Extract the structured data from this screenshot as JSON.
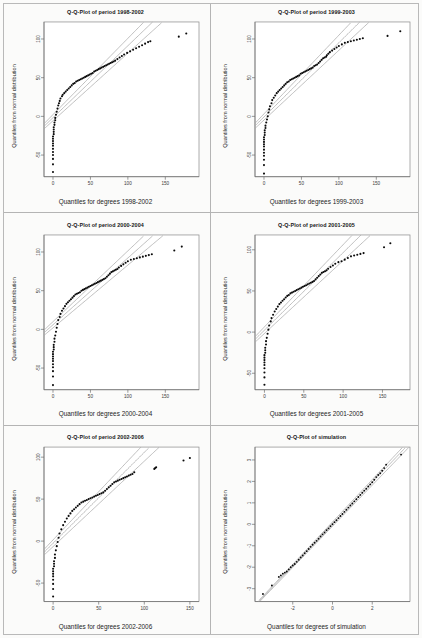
{
  "figure": {
    "kind": "qq-plot-grid",
    "rows": 3,
    "cols": 2,
    "background": "#fbfbfa",
    "divider_color": "#b4b4b4",
    "point_color": "#0a0a0a",
    "reference_line_color": "#a9a9a9"
  },
  "chart_data": [
    {
      "id": "panel-1",
      "type": "scatter",
      "title": "Q-Q-Plot of period 1998-2002",
      "xlabel": "Quantiles for degrees 1998-2002",
      "ylabel": "Quantiles from normal distribution",
      "xlim": [
        -12,
        195
      ],
      "ylim": [
        -78,
        122
      ],
      "xticks": [
        0,
        50,
        100,
        150
      ],
      "yticks": [
        100,
        50,
        0,
        -50
      ],
      "grid": false,
      "legend": "none",
      "reference_lines": 3,
      "annotation": "Heavy-tailed: steep lower tail, convex body, two far outliers near x=170-180",
      "x": [
        0,
        0,
        0,
        0,
        0,
        0,
        0,
        0,
        0,
        0,
        0,
        1,
        1,
        1,
        1,
        2,
        2,
        3,
        3,
        4,
        5,
        6,
        7,
        8,
        9,
        10,
        12,
        13,
        15,
        17,
        19,
        21,
        23,
        25,
        27,
        29,
        31,
        33,
        35,
        37,
        39,
        41,
        43,
        45,
        47,
        49,
        51,
        53,
        55,
        57,
        59,
        61,
        63,
        65,
        67,
        69,
        71,
        73,
        75,
        77,
        79,
        81,
        83,
        86,
        89,
        92,
        95,
        99,
        103,
        107,
        111,
        115,
        119,
        123,
        127,
        130,
        168,
        178
      ],
      "y": [
        -72,
        -62,
        -55,
        -50,
        -46,
        -42,
        -38,
        -35,
        -32,
        -29,
        -26,
        -23,
        -20,
        -17,
        -14,
        -11,
        -8,
        -5,
        -2,
        2,
        6,
        10,
        14,
        17,
        20,
        23,
        26,
        28,
        30,
        32,
        34,
        36,
        38,
        40,
        42,
        43,
        45,
        46,
        47,
        48,
        49,
        50,
        51,
        52,
        53,
        54,
        55,
        56,
        58,
        59,
        60,
        61,
        62,
        63,
        64,
        65,
        66,
        67,
        68,
        69,
        70,
        71,
        72,
        74,
        76,
        78,
        80,
        82,
        84,
        86,
        88,
        90,
        92,
        94,
        96,
        97,
        103,
        107
      ]
    },
    {
      "id": "panel-2",
      "type": "scatter",
      "title": "Q-Q-Plot of period 1999-2003",
      "xlabel": "Quantiles for degrees 1999-2003",
      "ylabel": "Quantiles from normal distribution",
      "xlim": [
        -12,
        195
      ],
      "ylim": [
        -78,
        122
      ],
      "xticks": [
        0,
        50,
        100,
        150
      ],
      "yticks": [
        100,
        50,
        0,
        -50
      ],
      "grid": false,
      "legend": "none",
      "reference_lines": 3,
      "annotation": "Similar heavy-tailed shape; outliers near x=165 and x=182",
      "x": [
        0,
        0,
        0,
        0,
        0,
        0,
        0,
        0,
        0,
        0,
        0,
        1,
        1,
        1,
        2,
        2,
        3,
        4,
        5,
        6,
        7,
        8,
        10,
        11,
        13,
        15,
        17,
        19,
        21,
        23,
        25,
        27,
        29,
        31,
        33,
        35,
        37,
        39,
        41,
        43,
        45,
        47,
        49,
        51,
        53,
        55,
        57,
        59,
        61,
        63,
        65,
        67,
        69,
        71,
        73,
        75,
        77,
        79,
        81,
        83,
        84,
        86,
        88,
        91,
        94,
        97,
        100,
        104,
        108,
        112,
        116,
        120,
        124,
        128,
        132,
        165,
        182
      ],
      "y": [
        -74,
        -63,
        -56,
        -51,
        -47,
        -43,
        -39,
        -36,
        -33,
        -30,
        -27,
        -24,
        -21,
        -18,
        -15,
        -12,
        -8,
        -4,
        0,
        5,
        9,
        13,
        17,
        21,
        24,
        27,
        30,
        32,
        34,
        36,
        38,
        40,
        42,
        44,
        45,
        47,
        48,
        49,
        50,
        51,
        52,
        53,
        55,
        56,
        57,
        58,
        59,
        60,
        61,
        62,
        63,
        65,
        66,
        67,
        69,
        71,
        73,
        75,
        76,
        77,
        79,
        81,
        83,
        85,
        87,
        89,
        91,
        93,
        95,
        96,
        97,
        98,
        99,
        100,
        101,
        104,
        110
      ]
    },
    {
      "id": "panel-3",
      "type": "scatter",
      "title": "Q-Q-Plot of period 2000-2004",
      "xlabel": "Quantiles for degrees 2000-2004",
      "ylabel": "Quantiles from normal distribution",
      "xlim": [
        -12,
        195
      ],
      "ylim": [
        -78,
        122
      ],
      "xticks": [
        0,
        50,
        100,
        150
      ],
      "yticks": [
        100,
        50,
        0,
        -50
      ],
      "grid": false,
      "legend": "none",
      "reference_lines": 3,
      "annotation": "Heavy-tailed; outliers near x=162 and x=172",
      "x": [
        0,
        0,
        0,
        0,
        0,
        0,
        0,
        0,
        0,
        0,
        1,
        1,
        1,
        2,
        2,
        3,
        4,
        5,
        6,
        7,
        9,
        10,
        12,
        14,
        16,
        18,
        20,
        22,
        24,
        26,
        28,
        30,
        32,
        34,
        36,
        38,
        40,
        42,
        44,
        46,
        48,
        50,
        52,
        54,
        56,
        58,
        60,
        62,
        64,
        66,
        68,
        70,
        72,
        74,
        76,
        78,
        80,
        82,
        84,
        86,
        88,
        91,
        94,
        97,
        100,
        104,
        108,
        112,
        116,
        120,
        124,
        128,
        132,
        162,
        172
      ],
      "y": [
        -72,
        -61,
        -54,
        -49,
        -45,
        -41,
        -38,
        -35,
        -32,
        -29,
        -26,
        -23,
        -20,
        -16,
        -12,
        -8,
        -3,
        2,
        7,
        12,
        16,
        20,
        24,
        27,
        30,
        33,
        35,
        37,
        39,
        41,
        43,
        45,
        46,
        47,
        48,
        50,
        51,
        52,
        53,
        54,
        55,
        56,
        57,
        58,
        59,
        60,
        61,
        62,
        63,
        64,
        65,
        66,
        68,
        70,
        72,
        74,
        75,
        76,
        77,
        78,
        80,
        82,
        84,
        86,
        88,
        90,
        91,
        92,
        93,
        94,
        95,
        96,
        97,
        102,
        107
      ]
    },
    {
      "id": "panel-4",
      "type": "scatter",
      "title": "Q-Q-Plot of period 2001-2005",
      "xlabel": "Quantiles for degrees 2001-2005",
      "ylabel": "Quantiles from normal distribution",
      "xlim": [
        -12,
        185
      ],
      "ylim": [
        -70,
        118
      ],
      "xticks": [
        0,
        50,
        100,
        150
      ],
      "yticks": [
        100,
        50,
        0,
        -50
      ],
      "grid": false,
      "legend": "none",
      "reference_lines": 3,
      "annotation": "Heavy-tailed; outlier pair near x=152-160",
      "x": [
        0,
        0,
        0,
        0,
        0,
        0,
        0,
        0,
        0,
        1,
        1,
        1,
        2,
        2,
        3,
        4,
        5,
        6,
        8,
        9,
        11,
        13,
        15,
        17,
        19,
        21,
        23,
        25,
        27,
        29,
        31,
        33,
        35,
        37,
        39,
        41,
        43,
        45,
        47,
        49,
        51,
        53,
        55,
        57,
        59,
        61,
        63,
        65,
        67,
        69,
        71,
        73,
        75,
        77,
        79,
        81,
        84,
        87,
        90,
        94,
        98,
        102,
        106,
        110,
        114,
        118,
        122,
        126,
        152,
        160
      ],
      "y": [
        -64,
        -55,
        -49,
        -44,
        -40,
        -37,
        -34,
        -31,
        -28,
        -25,
        -22,
        -19,
        -15,
        -11,
        -7,
        -2,
        3,
        8,
        13,
        17,
        21,
        25,
        28,
        31,
        34,
        36,
        38,
        40,
        42,
        44,
        45,
        47,
        48,
        49,
        50,
        51,
        52,
        53,
        54,
        55,
        56,
        57,
        58,
        59,
        60,
        61,
        62,
        64,
        66,
        68,
        70,
        72,
        73,
        74,
        75,
        77,
        79,
        81,
        83,
        85,
        86,
        88,
        90,
        92,
        93,
        94,
        95,
        96,
        103,
        108
      ]
    },
    {
      "id": "panel-5",
      "type": "scatter",
      "title": "Q-Q-Plot of period 2002-2006",
      "xlabel": "Quantiles for degrees 2002-2006",
      "ylabel": "Quantiles from normal distribution",
      "xlim": [
        -10,
        160
      ],
      "ylim": [
        -72,
        112
      ],
      "xticks": [
        0,
        50,
        100,
        150
      ],
      "yticks": [
        100,
        50,
        0,
        -50
      ],
      "grid": false,
      "legend": "none",
      "reference_lines": 3,
      "annotation": "Heavy-tailed; cluster near x=112 and outliers near x=143-150",
      "x": [
        0,
        0,
        0,
        0,
        0,
        0,
        0,
        0,
        1,
        1,
        1,
        2,
        2,
        3,
        4,
        5,
        6,
        7,
        9,
        11,
        13,
        15,
        17,
        19,
        21,
        23,
        25,
        27,
        29,
        31,
        33,
        35,
        37,
        39,
        41,
        43,
        45,
        47,
        49,
        51,
        53,
        55,
        57,
        59,
        61,
        63,
        65,
        67,
        69,
        71,
        73,
        75,
        77,
        79,
        81,
        83,
        85,
        87,
        89,
        111,
        112,
        113,
        143,
        150
      ],
      "y": [
        -66,
        -57,
        -51,
        -46,
        -42,
        -39,
        -36,
        -33,
        -30,
        -27,
        -24,
        -20,
        -16,
        -11,
        -6,
        -1,
        4,
        9,
        14,
        19,
        23,
        27,
        30,
        33,
        36,
        38,
        40,
        42,
        44,
        46,
        47,
        48,
        49,
        50,
        51,
        52,
        53,
        54,
        55,
        56,
        57,
        58,
        60,
        62,
        64,
        66,
        68,
        70,
        71,
        72,
        73,
        74,
        75,
        76,
        77,
        78,
        79,
        80,
        82,
        86,
        87,
        88,
        96,
        99
      ]
    },
    {
      "id": "panel-6",
      "type": "scatter",
      "title": "Q-Q-Plot of simulation",
      "xlabel": "Quantiles for degrees of simulation",
      "ylabel": "Quantiles from normal distribution",
      "xlim": [
        -3.9,
        3.9
      ],
      "ylim": [
        -3.6,
        3.6
      ],
      "xticks": [
        -2,
        0,
        2
      ],
      "yticks": [
        3,
        2,
        1,
        0,
        -1,
        -2,
        -3
      ],
      "grid": false,
      "legend": "none",
      "reference_lines": 3,
      "annotation": "Near-perfect linear agreement with the normal reference line",
      "x": [
        -3.5,
        -3.05,
        -2.7,
        -2.6,
        -2.5,
        -2.4,
        -2.3,
        -2.2,
        -2.1,
        -2.0,
        -1.9,
        -1.8,
        -1.7,
        -1.6,
        -1.5,
        -1.4,
        -1.3,
        -1.2,
        -1.1,
        -1.0,
        -0.9,
        -0.8,
        -0.7,
        -0.6,
        -0.5,
        -0.4,
        -0.3,
        -0.2,
        -0.1,
        0.0,
        0.1,
        0.2,
        0.3,
        0.4,
        0.5,
        0.6,
        0.7,
        0.8,
        0.9,
        1.0,
        1.1,
        1.2,
        1.3,
        1.4,
        1.5,
        1.6,
        1.7,
        1.8,
        1.9,
        2.0,
        2.1,
        2.2,
        2.3,
        2.4,
        2.5,
        2.6,
        2.7,
        3.45
      ],
      "y": [
        -3.25,
        -2.85,
        -2.45,
        -2.38,
        -2.3,
        -2.25,
        -2.2,
        -2.1,
        -2.0,
        -1.92,
        -1.85,
        -1.75,
        -1.65,
        -1.55,
        -1.45,
        -1.35,
        -1.25,
        -1.15,
        -1.05,
        -0.95,
        -0.86,
        -0.77,
        -0.67,
        -0.57,
        -0.47,
        -0.38,
        -0.28,
        -0.19,
        -0.09,
        0.0,
        0.1,
        0.19,
        0.29,
        0.39,
        0.48,
        0.58,
        0.68,
        0.78,
        0.88,
        0.97,
        1.07,
        1.17,
        1.27,
        1.37,
        1.47,
        1.57,
        1.66,
        1.76,
        1.86,
        1.96,
        2.08,
        2.2,
        2.3,
        2.38,
        2.5,
        2.62,
        2.78,
        3.25
      ]
    }
  ]
}
